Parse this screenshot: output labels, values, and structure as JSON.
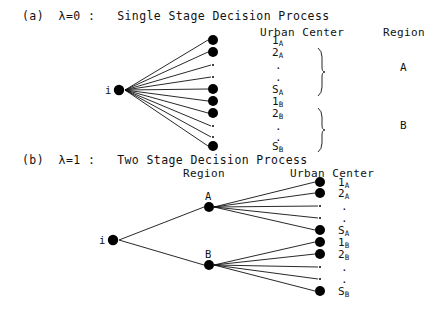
{
  "figure": {
    "background_color": "#ffffff",
    "ink_color": "#111111",
    "node_color": "#000000"
  },
  "panel_a": {
    "caption": "(a)  λ=0 :   Single Stage Decision Process",
    "lambda_value": "0",
    "panel_letter": "(a)",
    "process_name": "Single Stage Decision Process",
    "headers": {
      "urban_center": "Urban Center",
      "region": "Region"
    },
    "origin_node": {
      "label": "i",
      "x": 119,
      "y": 90
    },
    "urban_centers": [
      {
        "label": "1",
        "sub": "A",
        "kind": "node",
        "x": 213,
        "y": 40,
        "text_y": 41
      },
      {
        "label": "2",
        "sub": "A",
        "kind": "node",
        "x": 213,
        "y": 52,
        "text_y": 53
      },
      {
        "label": ".",
        "sub": "",
        "kind": "ellipsis",
        "x": 213,
        "y": 65,
        "text_y": 66
      },
      {
        "label": ".",
        "sub": "",
        "kind": "ellipsis",
        "x": 213,
        "y": 77,
        "text_y": 78
      },
      {
        "label": "S",
        "sub": "A",
        "kind": "node",
        "x": 213,
        "y": 89,
        "text_y": 90
      },
      {
        "label": "1",
        "sub": "B",
        "kind": "node",
        "x": 213,
        "y": 101,
        "text_y": 102
      },
      {
        "label": "2",
        "sub": "B",
        "kind": "node",
        "x": 213,
        "y": 113,
        "text_y": 114
      },
      {
        "label": ".",
        "sub": "",
        "kind": "ellipsis",
        "x": 213,
        "y": 126,
        "text_y": 127
      },
      {
        "label": ".",
        "sub": "",
        "kind": "ellipsis",
        "x": 213,
        "y": 137,
        "text_y": 138
      },
      {
        "label": "S",
        "sub": "B",
        "kind": "node",
        "x": 213,
        "y": 146,
        "text_y": 147
      }
    ],
    "regions": [
      {
        "label": "A",
        "brace_top": 48,
        "brace_bottom": 96,
        "label_y": 68
      },
      {
        "label": "B",
        "brace_top": 108,
        "brace_bottom": 152,
        "label_y": 126
      }
    ]
  },
  "panel_b": {
    "caption": "(b)  λ=1 :   Two Stage Decision Process",
    "lambda_value": "1",
    "panel_letter": "(b)",
    "process_name": "Two Stage Decision Process",
    "headers": {
      "region": "Region",
      "urban_center": "Urban Center"
    },
    "origin_node": {
      "label": "i",
      "x": 113,
      "y": 240
    },
    "region_nodes": [
      {
        "label": "A",
        "x": 209,
        "y": 207,
        "label_y": 196
      },
      {
        "label": "B",
        "x": 209,
        "y": 265,
        "label_y": 254
      }
    ],
    "urban_centers_a": [
      {
        "label": "1",
        "sub": "A",
        "kind": "node",
        "x": 320,
        "y": 182,
        "text_y": 183
      },
      {
        "label": "2",
        "sub": "A",
        "kind": "node",
        "x": 320,
        "y": 193,
        "text_y": 194
      },
      {
        "label": ".",
        "sub": "",
        "kind": "ellipsis",
        "x": 320,
        "y": 206,
        "text_y": 207
      },
      {
        "label": ".",
        "sub": "",
        "kind": "ellipsis",
        "x": 320,
        "y": 218,
        "text_y": 219
      },
      {
        "label": "S",
        "sub": "A",
        "kind": "node",
        "x": 320,
        "y": 230,
        "text_y": 231
      }
    ],
    "urban_centers_b": [
      {
        "label": "1",
        "sub": "B",
        "kind": "node",
        "x": 320,
        "y": 242,
        "text_y": 243
      },
      {
        "label": "2",
        "sub": "B",
        "kind": "node",
        "x": 320,
        "y": 254,
        "text_y": 255
      },
      {
        "label": ".",
        "sub": "",
        "kind": "ellipsis",
        "x": 320,
        "y": 267,
        "text_y": 268
      },
      {
        "label": ".",
        "sub": "",
        "kind": "ellipsis",
        "x": 320,
        "y": 279,
        "text_y": 280
      },
      {
        "label": "S",
        "sub": "B",
        "kind": "node",
        "x": 320,
        "y": 291,
        "text_y": 292
      }
    ]
  }
}
